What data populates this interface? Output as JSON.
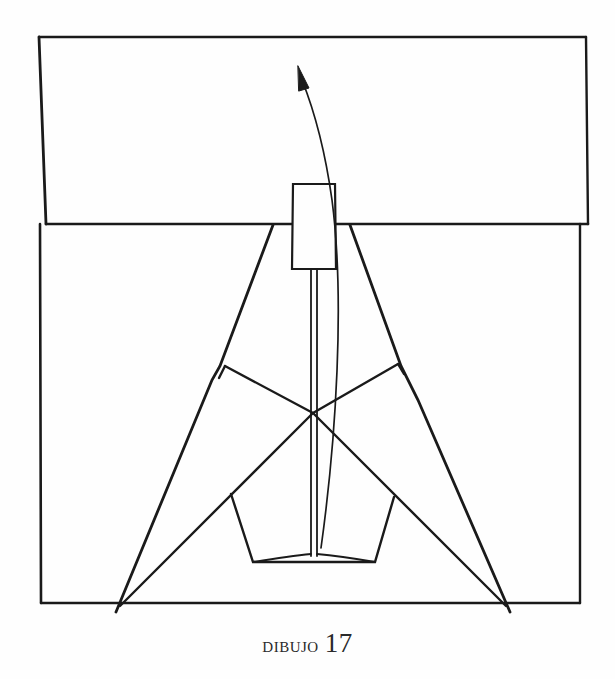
{
  "figure": {
    "caption_word": "DIBUJO",
    "caption_number": "17",
    "ink_color": "#1a1a1a",
    "paper_color": "#fefefe"
  },
  "elements": {
    "base_square": "base-square",
    "folded_flap": "folded-top-flap",
    "center_flap": "center-rectangular-flap",
    "stem": "center-stem",
    "fold_arrow": "curved-fold-arrow",
    "pentagon": "bottom-pentagon",
    "diagonals": "crossing-diagonal-lines",
    "kite_sides": "outer-kite-sides"
  }
}
